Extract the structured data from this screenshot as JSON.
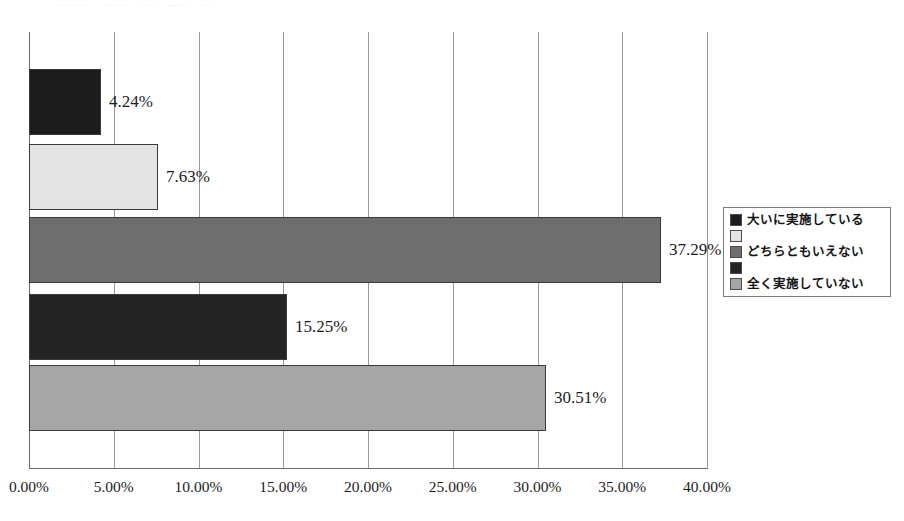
{
  "scan": {
    "top_artifact_text": "—·— ·· —— · —·· ——· ·—"
  },
  "chart_data": {
    "type": "bar",
    "orientation": "horizontal",
    "title": "",
    "subtitle": "",
    "xlabel": "",
    "ylabel": "",
    "categories": [
      "大いに実施している",
      "",
      "どちらともいえない",
      "",
      "全く実施していない"
    ],
    "values": [
      4.24,
      7.63,
      37.29,
      15.25,
      30.51
    ],
    "value_labels": [
      "4.24%",
      "7.63%",
      "37.29%",
      "15.25%",
      "30.51%"
    ],
    "bar_colors": [
      "#1c1c1c",
      "#e3e3e3",
      "#6e6e6e",
      "#242424",
      "#a6a6a6"
    ],
    "xlim": [
      0,
      40
    ],
    "xtick_values": [
      0,
      5,
      10,
      15,
      20,
      25,
      30,
      35,
      40
    ],
    "xtick_labels": [
      "0.00%",
      "5.00%",
      "10.00%",
      "15.00%",
      "20.00%",
      "25.00%",
      "30.00%",
      "35.00%",
      "40.00%"
    ],
    "grid": true,
    "grid_axis": "x",
    "legend_position": "right",
    "legend": [
      {
        "label": "大いに実施している",
        "color": "#1c1c1c"
      },
      {
        "label": "",
        "color": "#e3e3e3"
      },
      {
        "label": "どちらともいえない",
        "color": "#6e6e6e"
      },
      {
        "label": "",
        "color": "#242424"
      },
      {
        "label": "全く実施していない",
        "color": "#a6a6a6"
      }
    ]
  },
  "style": {
    "axis_color": "#6a6a6a",
    "grid_color": "#9a9a9a",
    "text_color": "#1c1c1c",
    "plot_background": "#ffffff"
  }
}
